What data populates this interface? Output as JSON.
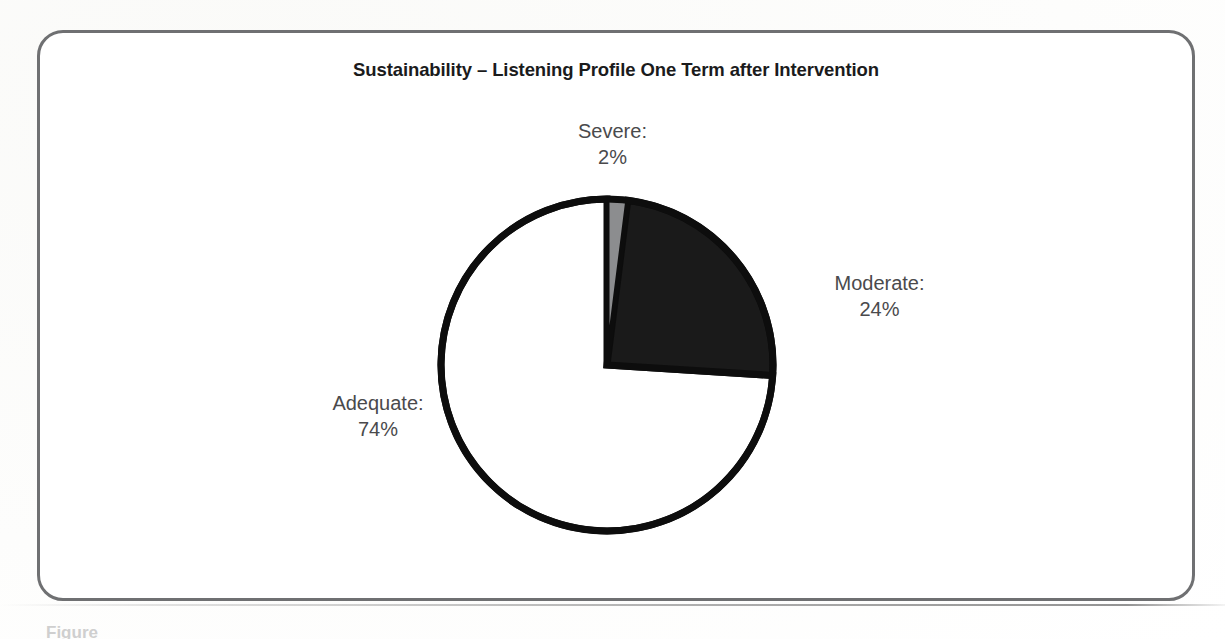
{
  "figure": {
    "title": "Sustainability – Listening Profile One Term after Intervention",
    "caption_fragment": "Figure"
  },
  "colors": {
    "frame_border": "#6f7072",
    "title_text": "#1b1b1c",
    "label_text": "#4a4a4c",
    "slice_outline": "#0d0d0d",
    "severe_fill": "#8c8d8f",
    "moderate_fill": "#1a1a1a",
    "adequate_fill": "#ffffff",
    "page_background": "#ffffff"
  },
  "chart_data": {
    "type": "pie",
    "title": "Sustainability – Listening Profile One Term after Intervention",
    "xlabel": "",
    "ylabel": "",
    "grid": false,
    "legend_position": "none",
    "labels_outside": true,
    "start_angle_deg": 0,
    "direction": "clockwise",
    "categories": [
      "Severe",
      "Moderate",
      "Adequate"
    ],
    "values": [
      2,
      24,
      74
    ],
    "unit": "%",
    "slices": [
      {
        "name": "Severe",
        "label": "Severe:",
        "value": 2,
        "value_text": "2%",
        "fill": "#8c8d8f",
        "start_deg": 0,
        "end_deg": 7.2
      },
      {
        "name": "Moderate",
        "label": "Moderate:",
        "value": 24,
        "value_text": "24%",
        "fill": "#1a1a1a",
        "start_deg": 7.2,
        "end_deg": 93.6
      },
      {
        "name": "Adequate",
        "label": "Adequate:",
        "value": 74,
        "value_text": "74%",
        "fill": "#ffffff",
        "start_deg": 93.6,
        "end_deg": 360
      }
    ],
    "annotations": [
      "Severe: 2%",
      "Moderate: 24%",
      "Adequate: 74%"
    ]
  }
}
